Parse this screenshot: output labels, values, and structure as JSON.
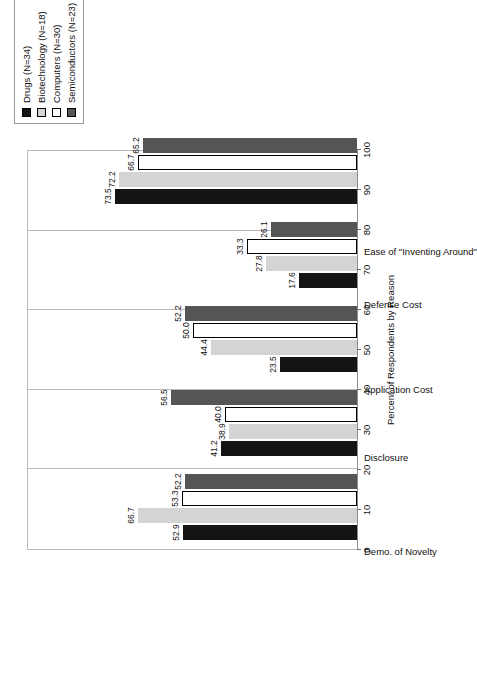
{
  "chart_data": {
    "type": "bar",
    "title": "",
    "xlabel": "",
    "ylabel": "Percent of Respondents by Reason",
    "ylim": [
      0,
      100
    ],
    "ytick_step": 10,
    "yticks": [
      "0",
      "10",
      "20",
      "30",
      "40",
      "50",
      "60",
      "70",
      "80",
      "90",
      "100"
    ],
    "grid": false,
    "orientation": "rotated-90",
    "legend_position": "top-left",
    "categories": [
      "Demo. of Novelty",
      "Disclosure",
      "Application Cost",
      "Defense Cost",
      "Ease of \"Inventing Around\""
    ],
    "series": [
      {
        "name": "Drugs (N=34)",
        "color": "#141414",
        "swatch": "filled-black",
        "values": [
          52.9,
          41.2,
          23.5,
          17.6,
          73.5
        ],
        "labels": [
          "52.9",
          "41.2",
          "23.5",
          "17.6",
          "73.5"
        ]
      },
      {
        "name": "Biotechnology (N=18)",
        "color": "#d4d4d4",
        "swatch": "light-gray",
        "values": [
          66.7,
          38.9,
          44.4,
          27.8,
          72.2
        ],
        "labels": [
          "66.7",
          "38.9",
          "44.4",
          "27.8",
          "72.2"
        ]
      },
      {
        "name": "Computers (N=30)",
        "color": "#ffffff",
        "swatch": "white",
        "values": [
          53.3,
          40.0,
          50.0,
          33.3,
          66.7
        ],
        "labels": [
          "53.3",
          "40.0",
          "50.0",
          "33.3",
          "66.7"
        ]
      },
      {
        "name": "Semiconductors (N=23)",
        "color": "#555555",
        "swatch": "dark-gray",
        "values": [
          52.2,
          56.5,
          52.2,
          26.1,
          65.2
        ],
        "labels": [
          "52.2",
          "56.5",
          "52.2",
          "26.1",
          "65.2"
        ]
      }
    ]
  },
  "legend": {
    "items": [
      {
        "label": "Drugs (N=34)",
        "color": "#141414"
      },
      {
        "label": "Biotechnology (N=18)",
        "color": "#d4d4d4"
      },
      {
        "label": "Computers (N=30)",
        "color": "#ffffff"
      },
      {
        "label": "Semiconductors (N=23)",
        "color": "#555555"
      }
    ]
  }
}
